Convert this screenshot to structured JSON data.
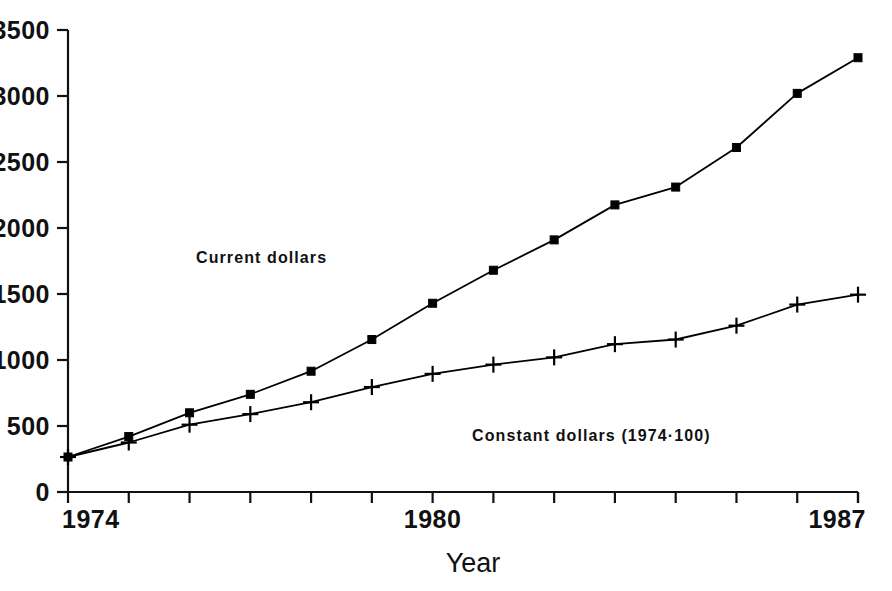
{
  "page": {
    "header_remnant": "",
    "page_number_remnant": ""
  },
  "chart_data": {
    "type": "line",
    "title": "",
    "xlabel": "Year",
    "ylabel": "",
    "x": [
      1974,
      1975,
      1976,
      1977,
      1978,
      1979,
      1980,
      1981,
      1982,
      1983,
      1984,
      1985,
      1986,
      1987
    ],
    "xtick_labels": [
      "1974",
      "1980",
      "1987"
    ],
    "xtick_values": [
      1974,
      1980,
      1987
    ],
    "ytick_labels": [
      "0",
      "500",
      "1000",
      "1500",
      "2000",
      "2500",
      "3000",
      "3500"
    ],
    "ytick_values": [
      0,
      500,
      1000,
      1500,
      2000,
      2500,
      3000,
      3500
    ],
    "xlim": [
      1974,
      1987
    ],
    "ylim": [
      0,
      3500
    ],
    "grid": false,
    "legend_position": "inline-annotation",
    "series": [
      {
        "name": "Current dollars",
        "marker": "square",
        "color": "#000000",
        "label_text": "Current dollars",
        "values": [
          265,
          420,
          600,
          740,
          915,
          1155,
          1430,
          1680,
          1910,
          2175,
          2310,
          2610,
          3020,
          3290
        ]
      },
      {
        "name": "Constant dollars (1974=100)",
        "marker": "plus",
        "color": "#000000",
        "label_text": "Constant dollars (1974·100)",
        "values": [
          265,
          375,
          510,
          590,
          680,
          795,
          895,
          965,
          1020,
          1120,
          1155,
          1260,
          1420,
          1495
        ]
      }
    ]
  }
}
